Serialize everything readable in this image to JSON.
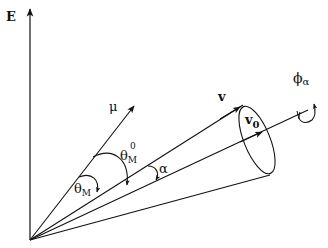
{
  "diagram": {
    "type": "vector-geometry",
    "labels": {
      "E": "E",
      "mu": "μ",
      "v": "v",
      "v0_base": "v",
      "v0_sub": "0",
      "theta_M0_base": "θ",
      "theta_M0_sub": "M",
      "theta_M0_sup": "0",
      "theta_M_base": "θ",
      "theta_M_sub": "M",
      "alpha": "α",
      "phi_base": "ϕ",
      "phi_sub": "α"
    },
    "elements": [
      {
        "name": "E axis",
        "kind": "vector"
      },
      {
        "name": "μ",
        "kind": "vector"
      },
      {
        "name": "v",
        "kind": "vector on cone surface"
      },
      {
        "name": "v0",
        "kind": "cone axis vector"
      },
      {
        "name": "cone",
        "kind": "cone with elliptical base"
      },
      {
        "name": "θM0",
        "kind": "angle between μ and v0"
      },
      {
        "name": "θM",
        "kind": "angle between μ and v"
      },
      {
        "name": "α",
        "kind": "cone half-angle between v and v0"
      },
      {
        "name": "ϕα",
        "kind": "rotation about v0 axis"
      }
    ],
    "colors": {
      "ink": "#111111",
      "background": "#ffffff"
    }
  }
}
